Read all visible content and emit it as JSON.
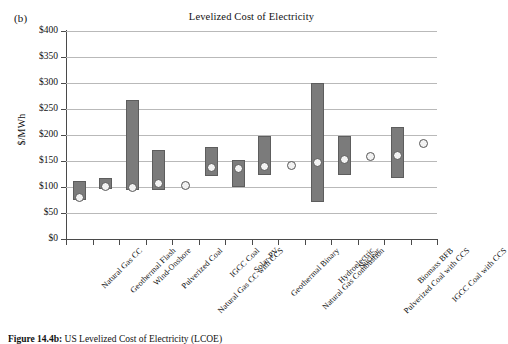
{
  "figure": {
    "panel_label": "(b)",
    "caption_prefix": "Figure 14.4b:",
    "caption_text": "US Levelized Cost of Electricity (LCOE)"
  },
  "chart_data": {
    "type": "bar",
    "title": "Levelized Cost of Electricity",
    "xlabel": "",
    "ylabel": "$/MWh",
    "ylim": [
      0,
      400
    ],
    "yticks": [
      0,
      50,
      100,
      150,
      200,
      250,
      300,
      350,
      400
    ],
    "ytick_labels": [
      "$0",
      "$50",
      "$100",
      "$150",
      "$200",
      "$250",
      "$300",
      "$350",
      "$400"
    ],
    "grid": true,
    "legend": "none",
    "series_notes": "Grey bars show the low-to-high LCOE range; open circles show the mean/point estimate.",
    "categories": [
      "Natural Gas CC",
      "Geothermal Flash",
      "Wind-Onshore",
      "Pulverized Coal",
      "Natural Gas CC with CCS",
      "IGCC Coal",
      "Solar-PV",
      "Geothermal Binary",
      "Natural Gas Combustion",
      "Hydroelectric",
      "Nuclear",
      "Pulverized Coal with CCS",
      "Biomass BFB",
      "IGCC Coal with CCS"
    ],
    "series": [
      {
        "name": "LCOE range low",
        "values": [
          75,
          97,
          94,
          94,
          null,
          121,
          100,
          123,
          null,
          72,
          123,
          null,
          117,
          null
        ]
      },
      {
        "name": "LCOE range high",
        "values": [
          112,
          117,
          267,
          172,
          null,
          177,
          152,
          198,
          null,
          300,
          198,
          null,
          215,
          null
        ]
      },
      {
        "name": "LCOE point estimate",
        "values": [
          79,
          101,
          100,
          106,
          103,
          138,
          136,
          140,
          141,
          147,
          152,
          158,
          161,
          184
        ]
      }
    ]
  },
  "colors": {
    "bar_fill": "#7b7b7b",
    "bar_stroke": "#5d5d5d",
    "marker_fill": "#f2f2f2",
    "marker_stroke": "#565656",
    "gridline": "#b9b9b9",
    "axis": "#4a4a4a",
    "background": "#ffffff",
    "text": "#111111"
  }
}
